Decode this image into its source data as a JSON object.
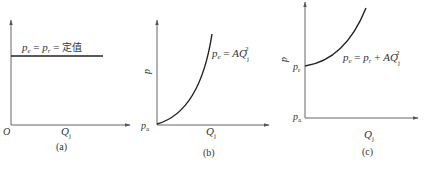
{
  "figure": {
    "panels": [
      {
        "id": "a",
        "caption": "(a)",
        "origin_label": "O",
        "x_axis_label": "Q",
        "x_axis_sub": "j",
        "equation": {
          "lhs": "p",
          "lhs_sub": "e",
          "eq1": " = ",
          "mid": "p",
          "mid_sub": "r",
          "eq2": " = ",
          "rhs": "定值"
        }
      },
      {
        "id": "b",
        "caption": "(b)",
        "y_axis_label": "p",
        "y_origin_label": "p",
        "y_origin_sub": "a",
        "x_axis_label": "Q",
        "x_axis_sub": "j",
        "equation": {
          "lhs": "p",
          "lhs_sub": "e",
          "eq": " = ",
          "rhs": "AQ",
          "rhs_sub": "j",
          "rhs_sup": "2"
        }
      },
      {
        "id": "c",
        "caption": "(c)",
        "y_axis_label": "p",
        "y_intercept_label": "p",
        "y_intercept_sub": "r",
        "y_origin_label": "p",
        "y_origin_sub": "a",
        "x_axis_label": "Q",
        "x_axis_sub": "j",
        "equation": {
          "lhs": "p",
          "lhs_sub": "e",
          "eq": " = ",
          "mid": "p",
          "mid_sub": "r",
          "plus": " + ",
          "rhs": "AQ",
          "rhs_sub": "j",
          "rhs_sup": "2"
        }
      }
    ],
    "colors": {
      "axis": "#555555",
      "curve": "#222222",
      "text": "#333333"
    }
  }
}
